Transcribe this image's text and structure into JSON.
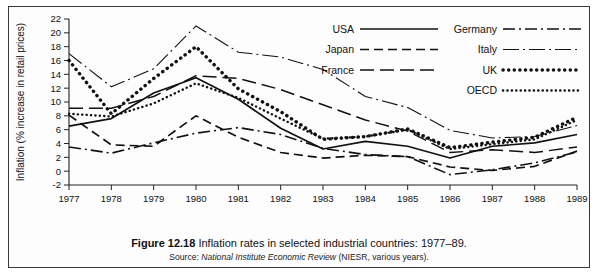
{
  "figure": {
    "caption_label": "Figure 12.18",
    "caption_text": "Inflation rates in selected industrial countries: 1977–89.",
    "source_prefix": "Source:",
    "source_italic": "National Institute Economic Review",
    "source_suffix": "(NIESR, various years)."
  },
  "chart_data": {
    "type": "line",
    "title": "Inflation rates in selected industrial countries: 1977–89",
    "xlabel": "",
    "ylabel": "Inflation (% increase in retail prices)",
    "xlim": [
      1977,
      1989
    ],
    "ylim": [
      -2,
      22
    ],
    "ytick_step": 2,
    "grid": false,
    "legend_position": "top-right",
    "x": [
      1977,
      1978,
      1979,
      1980,
      1981,
      1982,
      1983,
      1984,
      1985,
      1986,
      1987,
      1988,
      1989
    ],
    "xtick_labels": [
      "1977",
      "1978",
      "1979",
      "1980",
      "1981",
      "1982",
      "1983",
      "1984",
      "1985",
      "1986",
      "1987",
      "1988",
      "1989"
    ],
    "ytick_labels": [
      "-2",
      "0",
      "2",
      "4",
      "6",
      "8",
      "10",
      "12",
      "14",
      "16",
      "18",
      "20",
      "22"
    ],
    "series": [
      {
        "name": "USA",
        "style": "solid",
        "values": [
          6.5,
          7.6,
          11.3,
          13.5,
          10.4,
          6.2,
          3.2,
          4.3,
          3.6,
          1.9,
          3.6,
          4.1,
          5.3
        ]
      },
      {
        "name": "Japan",
        "style": "dashed",
        "values": [
          8.1,
          3.8,
          3.6,
          8.0,
          4.9,
          2.7,
          1.9,
          2.3,
          2.1,
          0.6,
          0.1,
          0.7,
          2.9
        ]
      },
      {
        "name": "France",
        "style": "long-dashed",
        "values": [
          9.1,
          9.1,
          10.8,
          13.8,
          13.4,
          11.8,
          9.6,
          7.4,
          5.8,
          2.7,
          3.1,
          2.7,
          3.5
        ]
      },
      {
        "name": "Germany",
        "style": "dash-dot",
        "values": [
          3.5,
          2.6,
          4.1,
          5.5,
          6.3,
          5.3,
          3.3,
          2.4,
          2.1,
          -0.5,
          0.2,
          1.2,
          2.8
        ]
      },
      {
        "name": "Italy",
        "style": "dash-dot-thin",
        "values": [
          17.0,
          12.2,
          14.8,
          21.0,
          17.2,
          16.5,
          14.7,
          10.8,
          9.2,
          5.9,
          4.8,
          5.0,
          6.6
        ]
      },
      {
        "name": "UK",
        "style": "thick-dotted",
        "values": [
          16.0,
          8.3,
          13.4,
          18.0,
          11.9,
          8.6,
          4.6,
          5.0,
          6.1,
          3.4,
          4.2,
          4.9,
          7.8
        ]
      },
      {
        "name": "OECD",
        "style": "fine-dotted",
        "values": [
          8.3,
          7.9,
          9.8,
          12.7,
          10.6,
          7.6,
          4.7,
          5.0,
          6.0,
          3.2,
          3.9,
          4.6,
          7.4
        ]
      }
    ]
  },
  "legend": {
    "entries": [
      {
        "label": "USA",
        "style": "solid"
      },
      {
        "label": "Japan",
        "style": "dashed"
      },
      {
        "label": "France",
        "style": "long-dashed"
      },
      {
        "label": "Germany",
        "style": "dash-dot"
      },
      {
        "label": "Italy",
        "style": "dash-dot-thin"
      },
      {
        "label": "UK",
        "style": "thick-dotted"
      },
      {
        "label": "OECD",
        "style": "fine-dotted"
      }
    ]
  },
  "colors": {
    "ink": "#111111",
    "frame": "#3a3a3a",
    "paper": "#fdfdfd"
  }
}
